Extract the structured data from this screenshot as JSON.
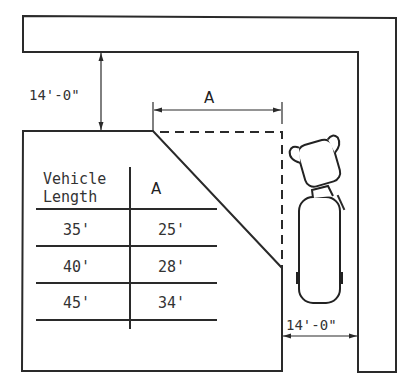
{
  "diagram": {
    "type": "truck-loading-dock-layout",
    "dimensions": {
      "top_clearance": "14'-0\"",
      "bottom_clearance": "14'-0\"",
      "setback_label": "A"
    },
    "table": {
      "headers": {
        "col1_line1": "Vehicle",
        "col1_line2": "Length",
        "col2": "A"
      },
      "rows": [
        {
          "vehicle_length": "35'",
          "a": "25'"
        },
        {
          "vehicle_length": "40'",
          "a": "28'"
        },
        {
          "vehicle_length": "45'",
          "a": "34'"
        }
      ]
    },
    "colors": {
      "line": "#2a2a2a",
      "background": "#ffffff"
    }
  }
}
